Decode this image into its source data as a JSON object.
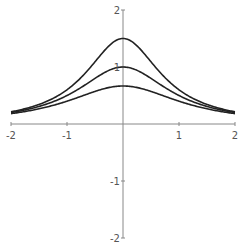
{
  "chart_data": {
    "type": "line",
    "title": "",
    "xlabel": "",
    "ylabel": "",
    "xlim": [
      -2,
      2
    ],
    "ylim": [
      -2,
      2
    ],
    "grid": false,
    "legend": null,
    "x_ticks": [
      -2,
      -1,
      1,
      2
    ],
    "y_ticks": [
      -2,
      -1,
      1,
      2
    ],
    "x_tick_labels": [
      "-2",
      "-1",
      "1",
      "2"
    ],
    "y_tick_labels": [
      "-2",
      "-1",
      "1",
      "2"
    ],
    "function_family": "a/(1+a*x^2)",
    "series": [
      {
        "name": "a=1.5",
        "a": 1.5,
        "x": [
          -2,
          -1.5,
          -1,
          -0.5,
          0,
          0.5,
          1,
          1.5,
          2
        ],
        "values": [
          0.214,
          0.343,
          0.6,
          1.091,
          1.5,
          1.091,
          0.6,
          0.343,
          0.214
        ]
      },
      {
        "name": "a=1",
        "a": 1.0,
        "x": [
          -2,
          -1.5,
          -1,
          -0.5,
          0,
          0.5,
          1,
          1.5,
          2
        ],
        "values": [
          0.2,
          0.308,
          0.5,
          0.8,
          1.0,
          0.8,
          0.5,
          0.308,
          0.2
        ]
      },
      {
        "name": "a=0.667",
        "a": 0.6667,
        "x": [
          -2,
          -1.5,
          -1,
          -0.5,
          0,
          0.5,
          1,
          1.5,
          2
        ],
        "values": [
          0.182,
          0.267,
          0.4,
          0.571,
          0.667,
          0.571,
          0.4,
          0.267,
          0.182
        ]
      }
    ]
  },
  "style": {
    "axis_color": "#888888",
    "curve_color": "#222222",
    "label_color": "#555555"
  }
}
